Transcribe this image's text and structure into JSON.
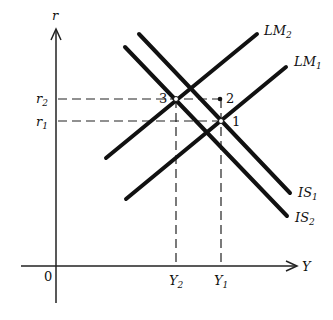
{
  "axes": {
    "y_label": "r",
    "x_label": "Y",
    "origin_label": "0"
  },
  "levels": {
    "r2": {
      "base": "r",
      "sub": "2"
    },
    "r1": {
      "base": "r",
      "sub": "1"
    },
    "Y2": {
      "base": "Y",
      "sub": "2"
    },
    "Y1": {
      "base": "Y",
      "sub": "1"
    }
  },
  "curves": {
    "LM2": {
      "base": "LM",
      "sub": "2"
    },
    "LM1": {
      "base": "LM",
      "sub": "1"
    },
    "IS1": {
      "base": "IS",
      "sub": "1"
    },
    "IS2": {
      "base": "IS",
      "sub": "2"
    }
  },
  "points": {
    "p1": "1",
    "p2": "2",
    "p3": "3"
  },
  "colors": {
    "ink": "#111111",
    "background": "#ffffff"
  }
}
